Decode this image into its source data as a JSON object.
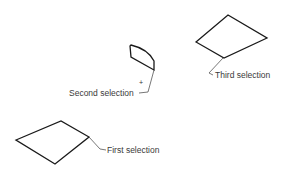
{
  "diagram": {
    "type": "selection-callouts",
    "background": "#ffffff",
    "stroke_color": "#1a1a1a",
    "text_color": "#3a3a3a",
    "shapes": [
      {
        "id": "first",
        "label": "First selection",
        "kind": "quadrilateral"
      },
      {
        "id": "second",
        "label": "Second selection",
        "kind": "curved-quadrilateral"
      },
      {
        "id": "third",
        "label": "Third selection",
        "kind": "quadrilateral"
      }
    ],
    "marker": "+"
  }
}
